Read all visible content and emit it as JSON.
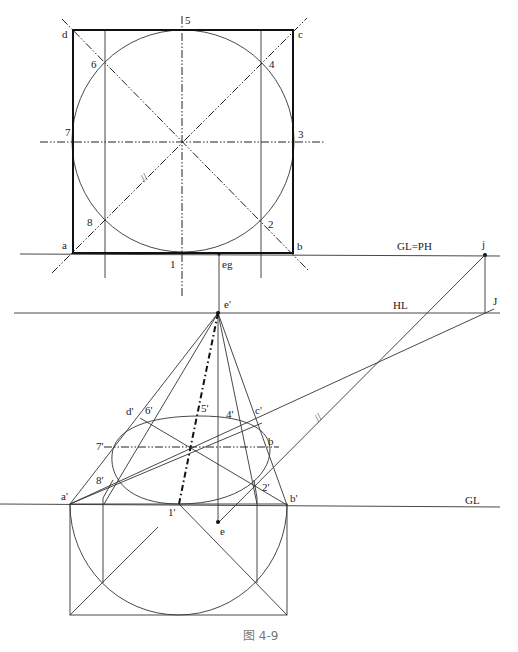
{
  "figure": {
    "caption": "图 4-9",
    "plan_view": {
      "corners": {
        "a": "a",
        "b": "b",
        "c": "c",
        "d": "d"
      },
      "circle_points": {
        "p1": "1",
        "p2": "2",
        "p3": "3",
        "p4": "4",
        "p5": "5",
        "p6": "6",
        "p7": "7",
        "p8": "8"
      },
      "eg_label": "eg",
      "parallel_mark": "//"
    },
    "lines": {
      "gl_ph": "GL=PH",
      "hl": "HL",
      "gl": "GL"
    },
    "points": {
      "j": "j",
      "J": "J",
      "e_prime": "e'",
      "e": "e"
    },
    "perspective_view": {
      "corners": {
        "a": "a'",
        "b": "b'",
        "c": "c'",
        "d": "d'"
      },
      "circle_points": {
        "p1": "1'",
        "p2": "2'",
        "p4": "4'",
        "p5": "5'",
        "p6": "6'",
        "p7": "7'",
        "p8": "8'"
      },
      "b_label": "b",
      "parallel_mark": "//"
    }
  }
}
